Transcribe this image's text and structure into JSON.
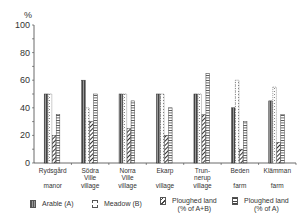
{
  "chart_data": {
    "type": "bar",
    "title": "",
    "xlabel": "",
    "ylabel": "%",
    "ylim": [
      0,
      100
    ],
    "yticks": [
      0,
      20,
      40,
      60,
      80,
      100
    ],
    "grid": false,
    "legend_position": "bottom",
    "categories": [
      {
        "line1": "Rydsgård",
        "line2": "",
        "line3": "manor"
      },
      {
        "line1": "Södra",
        "line2": "Ville",
        "line3": "village"
      },
      {
        "line1": "Norra",
        "line2": "Ville",
        "line3": "village"
      },
      {
        "line1": "Ekarp",
        "line2": "",
        "line3": "village"
      },
      {
        "line1": "Trun-",
        "line2": "nerup",
        "line3": "village"
      },
      {
        "line1": "Beden",
        "line2": "",
        "line3": "farm"
      },
      {
        "line1": "Klämman",
        "line2": "",
        "line3": "farm"
      }
    ],
    "category_names": [
      "Rydsgård manor",
      "Södra Ville village",
      "Norra Ville village",
      "Ekarp village",
      "Trun-nerup village",
      "Beden farm",
      "Klämman farm"
    ],
    "series": [
      {
        "name": "Arable (A)",
        "pattern": "dark-vertical",
        "values": [
          50,
          60,
          50,
          50,
          50,
          40,
          45
        ]
      },
      {
        "name": "Meadow (B)",
        "pattern": "dotted-white",
        "values": [
          50,
          40,
          50,
          50,
          50,
          60,
          55
        ]
      },
      {
        "name": "Ploughed land (% of A+B)",
        "pattern": "diagonal-hatch",
        "values": [
          20,
          30,
          25,
          20,
          35,
          10,
          15
        ]
      },
      {
        "name": "Ploughed land (% of A)",
        "pattern": "horizontal-hatch",
        "values": [
          35,
          50,
          45,
          40,
          65,
          30,
          35
        ]
      }
    ]
  },
  "legend": [
    {
      "label": "Arable (A)"
    },
    {
      "label": "Meadow (B)"
    },
    {
      "label": "Ploughed land\n(% of A+B)"
    },
    {
      "label": "Ploughed land\n(% of A)"
    }
  ],
  "axis": {
    "unit": "%"
  }
}
